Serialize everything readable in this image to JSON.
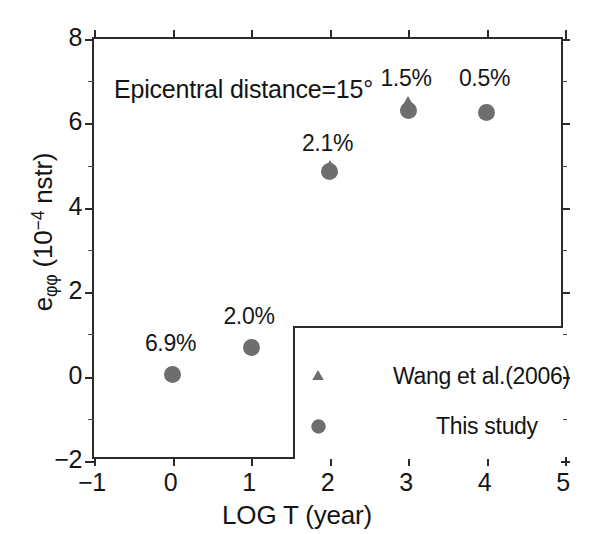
{
  "chart_data": {
    "type": "scatter",
    "title": "",
    "annotation_note": "Epicentral distance=15°",
    "xlabel": "LOG T (year)",
    "ylabel": "eφφ (10−4 nstr)",
    "ylabel_parts": {
      "base": "e",
      "sub": "φφ",
      "open": " (10",
      "exp": "−4",
      "close": " nstr)"
    },
    "xlim": [
      -1,
      5
    ],
    "ylim": [
      -2,
      8
    ],
    "xticks": [
      -1,
      0,
      1,
      2,
      3,
      4,
      5
    ],
    "xtick_labels": [
      "−1",
      "0",
      "1",
      "2",
      "3",
      "4",
      "5"
    ],
    "yticks": [
      -2,
      0,
      2,
      4,
      6,
      8
    ],
    "ytick_labels": [
      "−2",
      "0",
      "2",
      "4",
      "6",
      "8"
    ],
    "y_minor_ticks": [
      -1,
      1,
      3,
      5,
      7
    ],
    "grid": false,
    "legend_position": "bottom-right",
    "marker_color": "#6e6e6e",
    "axis_color": "#2b2b2b",
    "series": [
      {
        "name": "Wang et al.(2006)",
        "marker": "triangle",
        "x": [
          2,
          3
        ],
        "y": [
          4.95,
          6.45
        ]
      },
      {
        "name": "This study",
        "marker": "circle",
        "x": [
          0,
          1,
          2,
          3,
          4
        ],
        "y": [
          0.05,
          0.7,
          4.85,
          6.3,
          6.25
        ]
      }
    ],
    "point_labels": [
      {
        "text": "6.9%",
        "x": 0,
        "y": 1.0
      },
      {
        "text": "2.0%",
        "x": 1,
        "y": 1.65
      },
      {
        "text": "2.1%",
        "x": 2,
        "y": 5.75
      },
      {
        "text": "1.5%",
        "x": 3,
        "y": 7.3
      },
      {
        "text": "0.5%",
        "x": 4,
        "y": 7.3
      }
    ]
  },
  "legend": {
    "entries": [
      {
        "label": "Wang et al.(2006)",
        "marker": "triangle"
      },
      {
        "label": "This study",
        "marker": "circle"
      }
    ]
  }
}
